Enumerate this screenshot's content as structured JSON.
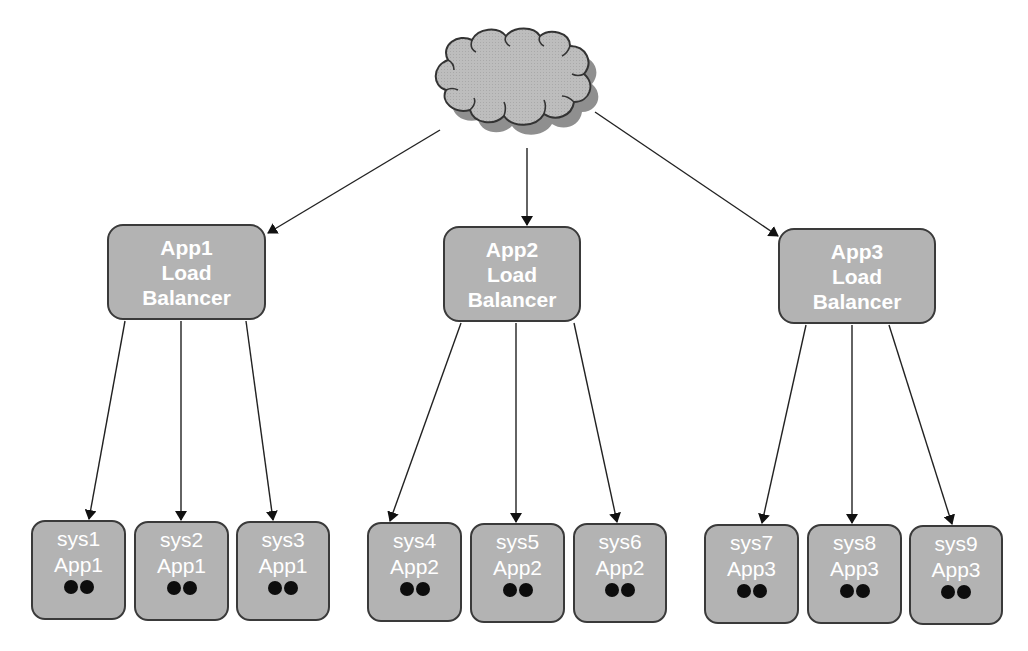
{
  "diagram": {
    "cloud": {
      "label": "",
      "fill": "#bdbdbd",
      "shadow": "#8f8f8f"
    },
    "load_balancers": [
      {
        "id": "lb1",
        "lines": [
          "App1",
          "Load",
          "Balancer"
        ],
        "x": 107,
        "y": 224,
        "w": 159,
        "h": 96
      },
      {
        "id": "lb2",
        "lines": [
          "App2",
          "Load",
          "Balancer"
        ],
        "x": 443,
        "y": 226,
        "w": 138,
        "h": 96
      },
      {
        "id": "lb3",
        "lines": [
          "App3",
          "Load",
          "Balancer"
        ],
        "x": 778,
        "y": 228,
        "w": 158,
        "h": 96
      }
    ],
    "systems": [
      {
        "id": "sys1",
        "name": "sys1",
        "app": "App1",
        "dots": 2,
        "x": 31,
        "y": 520,
        "w": 95,
        "h": 100,
        "lb": 0
      },
      {
        "id": "sys2",
        "name": "sys2",
        "app": "App1",
        "dots": 2,
        "x": 134,
        "y": 521,
        "w": 95,
        "h": 100,
        "lb": 0
      },
      {
        "id": "sys3",
        "name": "sys3",
        "app": "App1",
        "dots": 2,
        "x": 236,
        "y": 521,
        "w": 94,
        "h": 100,
        "lb": 0
      },
      {
        "id": "sys4",
        "name": "sys4",
        "app": "App2",
        "dots": 2,
        "x": 367,
        "y": 522,
        "w": 95,
        "h": 100,
        "lb": 1
      },
      {
        "id": "sys5",
        "name": "sys5",
        "app": "App2",
        "dots": 2,
        "x": 470,
        "y": 523,
        "w": 95,
        "h": 100,
        "lb": 1
      },
      {
        "id": "sys6",
        "name": "sys6",
        "app": "App2",
        "dots": 2,
        "x": 573,
        "y": 523,
        "w": 94,
        "h": 100,
        "lb": 1
      },
      {
        "id": "sys7",
        "name": "sys7",
        "app": "App3",
        "dots": 2,
        "x": 704,
        "y": 524,
        "w": 95,
        "h": 100,
        "lb": 2
      },
      {
        "id": "sys8",
        "name": "sys8",
        "app": "App3",
        "dots": 2,
        "x": 807,
        "y": 524,
        "w": 95,
        "h": 100,
        "lb": 2
      },
      {
        "id": "sys9",
        "name": "sys9",
        "app": "App3",
        "dots": 2,
        "x": 909,
        "y": 525,
        "w": 94,
        "h": 100,
        "lb": 2
      }
    ],
    "edges": [
      {
        "from": "cloud",
        "to": "lb1",
        "x1": 440,
        "y1": 130,
        "x2": 268,
        "y2": 233
      },
      {
        "from": "cloud",
        "to": "lb2",
        "x1": 527,
        "y1": 148,
        "x2": 527,
        "y2": 225
      },
      {
        "from": "cloud",
        "to": "lb3",
        "x1": 595,
        "y1": 112,
        "x2": 778,
        "y2": 236
      },
      {
        "from": "lb1",
        "to": "sys1",
        "x1": 125,
        "y1": 321,
        "x2": 89,
        "y2": 519
      },
      {
        "from": "lb1",
        "to": "sys2",
        "x1": 181,
        "y1": 321,
        "x2": 181,
        "y2": 520
      },
      {
        "from": "lb1",
        "to": "sys3",
        "x1": 246,
        "y1": 321,
        "x2": 273,
        "y2": 520
      },
      {
        "from": "lb2",
        "to": "sys4",
        "x1": 461,
        "y1": 323,
        "x2": 390,
        "y2": 521
      },
      {
        "from": "lb2",
        "to": "sys5",
        "x1": 516,
        "y1": 323,
        "x2": 516,
        "y2": 522
      },
      {
        "from": "lb2",
        "to": "sys6",
        "x1": 574,
        "y1": 323,
        "x2": 617,
        "y2": 522
      },
      {
        "from": "lb3",
        "to": "sys7",
        "x1": 806,
        "y1": 325,
        "x2": 762,
        "y2": 523
      },
      {
        "from": "lb3",
        "to": "sys8",
        "x1": 852,
        "y1": 325,
        "x2": 852,
        "y2": 523
      },
      {
        "from": "lb3",
        "to": "sys9",
        "x1": 889,
        "y1": 325,
        "x2": 952,
        "y2": 524
      }
    ]
  }
}
